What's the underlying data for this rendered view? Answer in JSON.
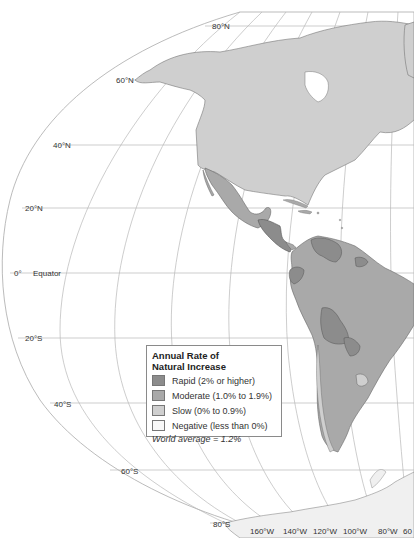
{
  "legend": {
    "title_line1": "Annual Rate of",
    "title_line2": "Natural Increase",
    "items": [
      {
        "label": "Rapid (2% or higher)",
        "color": "#8c8c8c"
      },
      {
        "label": "Moderate (1.0% to 1.9%)",
        "color": "#a9a9a9"
      },
      {
        "label": "Slow (0% to 0.9%)",
        "color": "#cfcfcf"
      },
      {
        "label": "Negative (less than 0%)",
        "color": "#f8f8f8"
      }
    ],
    "footnote": "World average = 1.2%"
  },
  "latitude_labels": {
    "n80": "80°N",
    "n60": "60°N",
    "n40": "40°N",
    "n20": "20°N",
    "eq_deg": "0°",
    "eq_name": "Equator",
    "s20": "20°S",
    "s40": "40°S",
    "s60": "60°S",
    "s80": "80°S"
  },
  "longitude_labels": [
    "160°W",
    "140°W",
    "120°W",
    "100°W",
    "80°W",
    "60"
  ],
  "colors": {
    "ocean": "#ffffff",
    "graticule": "#b8b8b8",
    "slow_land": "#cfcfcf",
    "moderate_land": "#a9a9a9",
    "rapid_land": "#8c8c8c",
    "border": "#666666"
  }
}
